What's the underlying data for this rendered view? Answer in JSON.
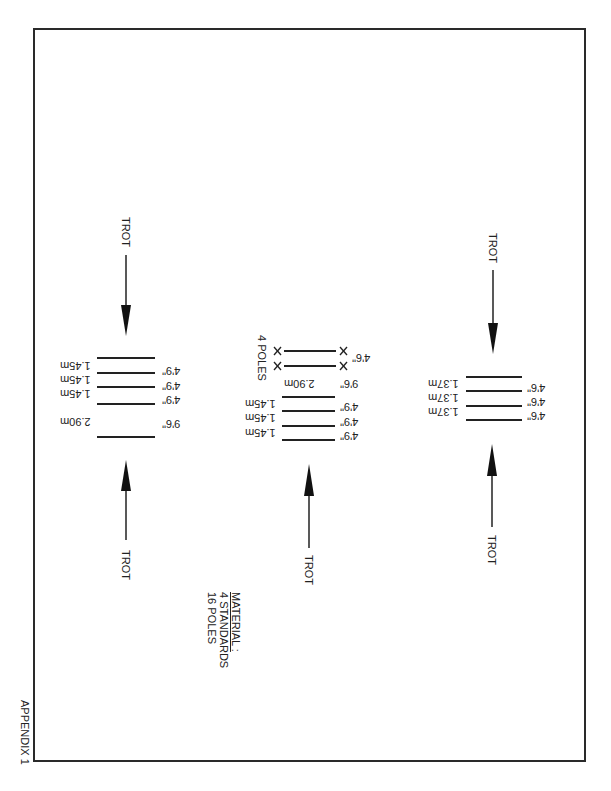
{
  "appendix_label": "APPENDIX 1",
  "material": {
    "heading": "MATERIAL :",
    "lines": [
      "4   STANDARDS",
      "16   POLES"
    ]
  },
  "direction_label": "TROT",
  "exercises": [
    {
      "name": "left",
      "top_arrow": true,
      "bottom_arrow": true,
      "poles": [
        {
          "metric": "1.45m",
          "imperial": "4'9\""
        },
        {
          "metric": "1.45m",
          "imperial": "4'9\""
        },
        {
          "metric": "1.45m",
          "imperial": "4'9\""
        },
        {
          "metric": "2.90m",
          "imperial": "9'6\""
        }
      ]
    },
    {
      "name": "middle",
      "top_arrow": false,
      "bottom_arrow": true,
      "raised_poles_label": "4 POLES",
      "raised_poles_spacing": "4'6\"",
      "poles": [
        {
          "metric": "2.90m",
          "imperial": "9'6\""
        },
        {
          "metric": "1.45m",
          "imperial": "4'9\""
        },
        {
          "metric": "1.45m",
          "imperial": "4'9\""
        },
        {
          "metric": "1.45m",
          "imperial": "4'9\""
        }
      ]
    },
    {
      "name": "right",
      "top_arrow": true,
      "bottom_arrow": true,
      "poles": [
        {
          "metric": "1.37m",
          "imperial": "4'6\""
        },
        {
          "metric": "1.37m",
          "imperial": "4'6\""
        },
        {
          "metric": "1.37m",
          "imperial": "4'6\""
        }
      ]
    }
  ]
}
